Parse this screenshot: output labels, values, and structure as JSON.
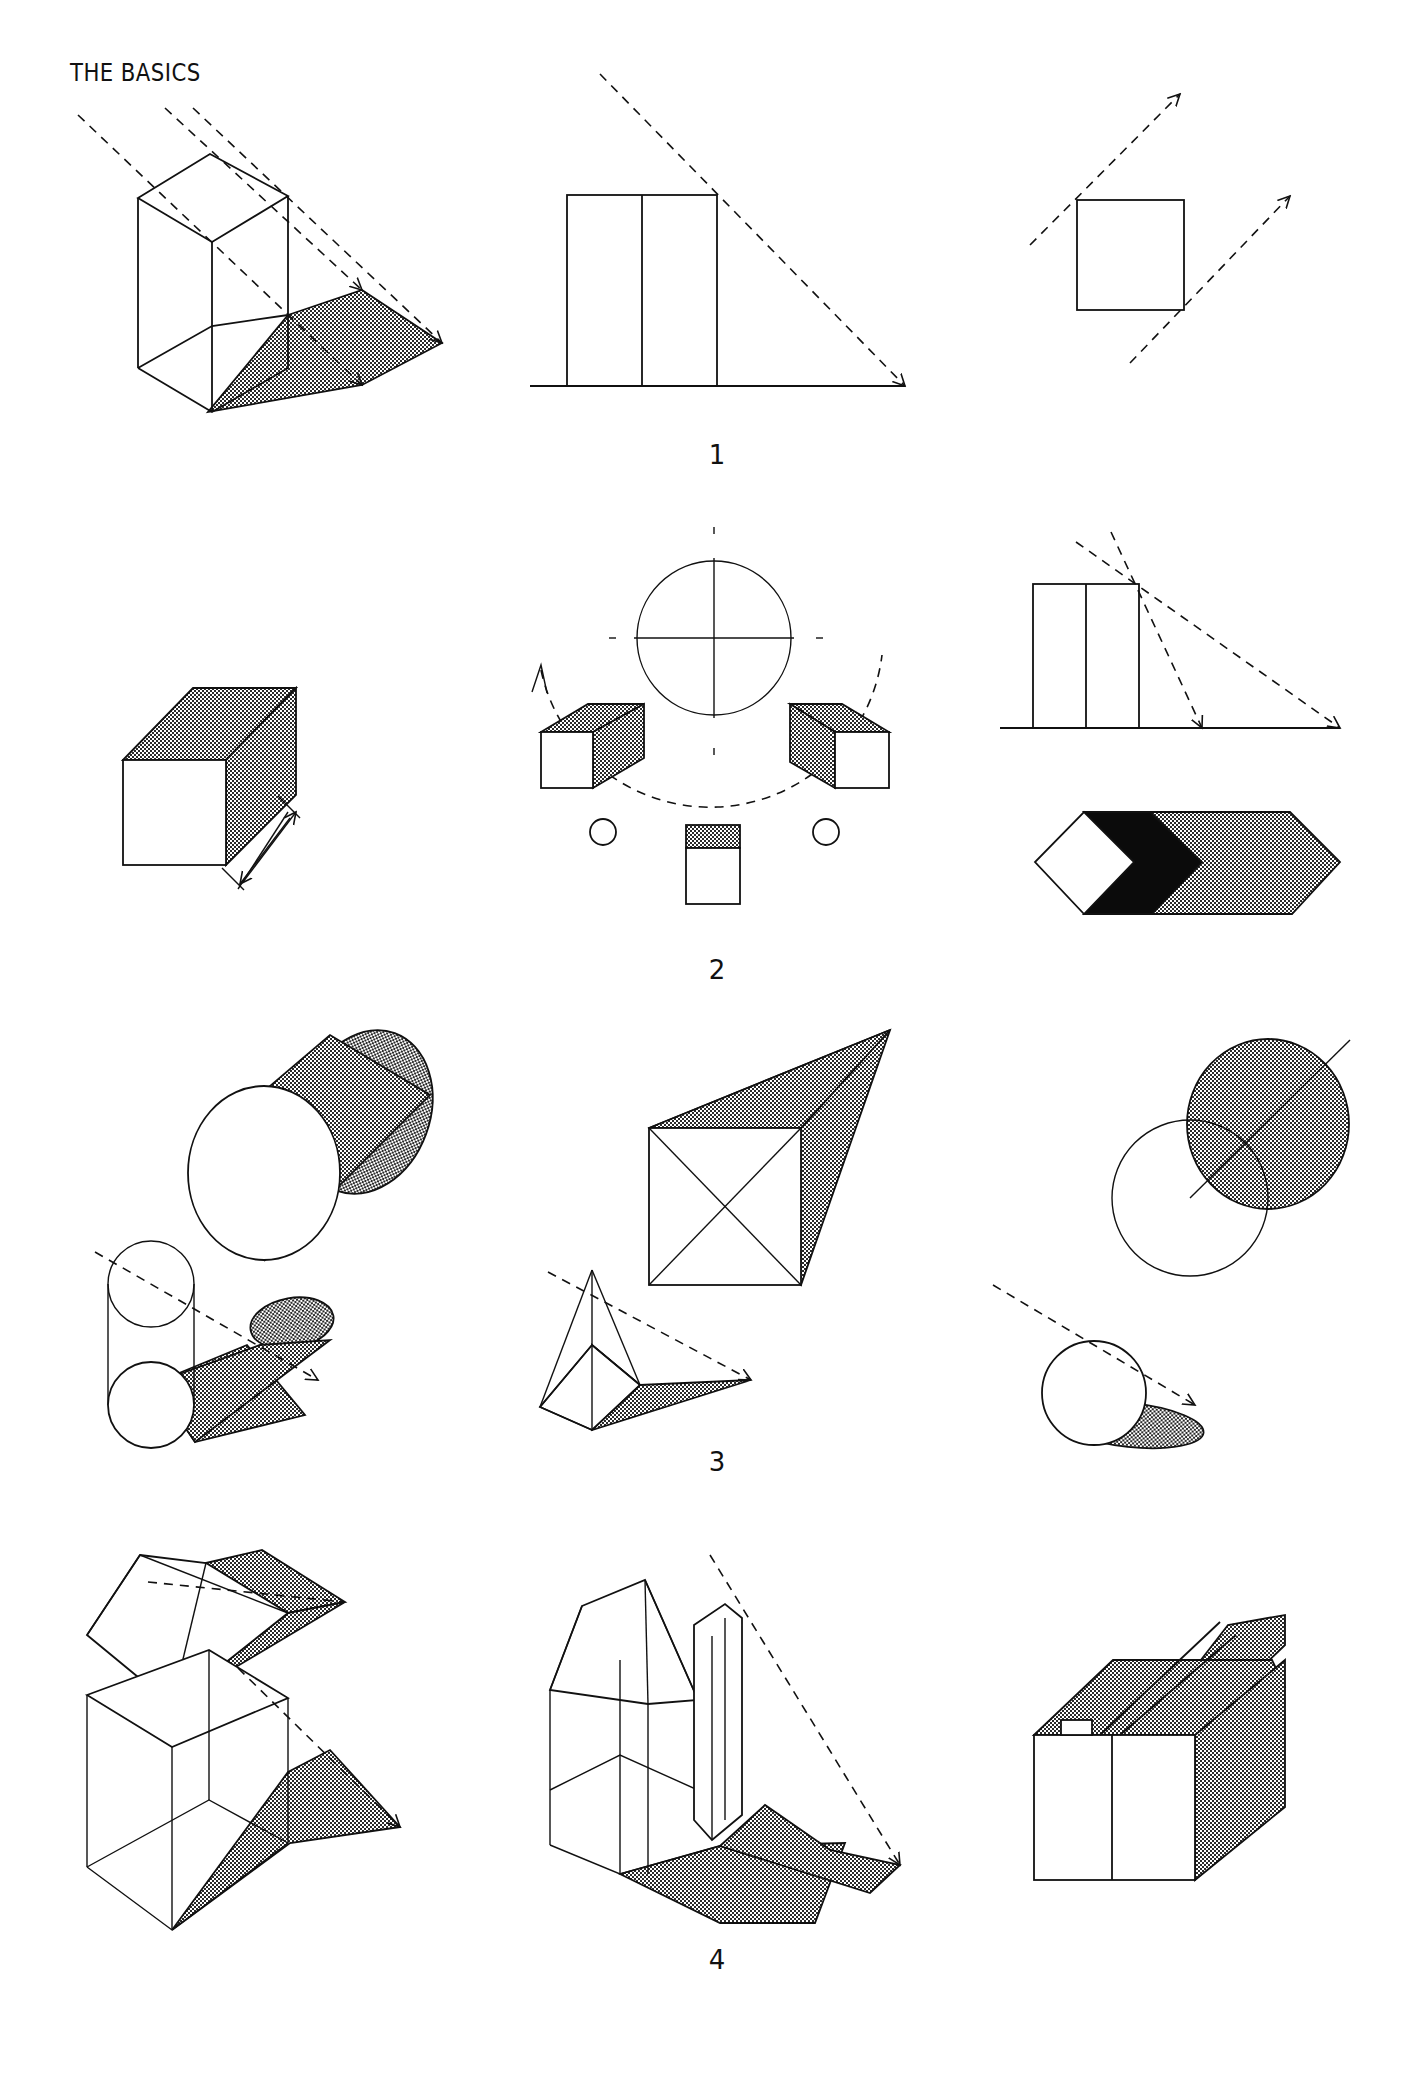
{
  "page": {
    "title": "THE BASICS",
    "figure_numbers": [
      "1",
      "2",
      "3",
      "4"
    ]
  },
  "figures": [
    {
      "number": "1",
      "panels": [
        "isometric tall box casting parallelogram shadow along dashed light rays",
        "elevation of block on ground line with dashed 45-degree light ray to shadow tip",
        "plan of square with two parallel dashed light rays"
      ]
    },
    {
      "number": "2",
      "panels": [
        "box with shaded top and side and dimension arrow",
        "sun path diagram: circle with crosshair, three cubes and two suns on dashed arc",
        "elevation with two light angles and plan with white, black and stippled shadow bands"
      ]
    },
    {
      "number": "3",
      "panels": [
        "disc and cylinder shadows",
        "square and pyramid shadows",
        "circle and sphere shadows"
      ]
    },
    {
      "number": "4",
      "panels": [
        "gable roof and box shadow construction",
        "house with chimney shadow construction",
        "rendered house with cast shadows"
      ]
    }
  ],
  "colors": {
    "ink": "#111111",
    "paper": "#ffffff",
    "stipple": "#8a8a8a"
  }
}
